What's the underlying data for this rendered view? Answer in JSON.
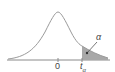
{
  "diagram": {
    "type": "t-distribution-right-tail",
    "labels": {
      "center": "0",
      "critical": "t",
      "critical_sub": "α",
      "tail_area": "α"
    },
    "colors": {
      "curve": "#9a9a9a",
      "axis": "#8a8a8a",
      "tail_fill": "#a8a8a8",
      "text": "#444444"
    }
  }
}
